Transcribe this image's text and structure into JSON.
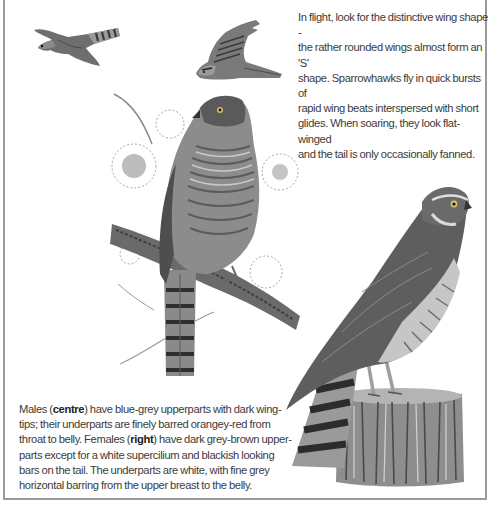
{
  "captions": {
    "flight": {
      "lines": [
        "In flight, look for the distinctive wing shape -",
        "the rather rounded wings almost form an 'S'",
        "shape. Sparrowhawks fly in quick bursts of",
        "rapid wing beats interspersed with short",
        "glides. When soaring, they look flat-winged",
        "and the tail is only occasionally fanned."
      ]
    },
    "plumage": {
      "line1_a": "Males (",
      "line1_bold": "centre",
      "line1_b": ") have blue-grey upperparts with dark wing-",
      "line2": "tips; their underparts are finely barred orangey-red from",
      "line3_a": "throat to belly. Females (",
      "line3_bold": "right",
      "line3_b": ") have dark grey-brown upper-",
      "line4": "parts except for a white supercilium and blackish looking",
      "line5": "bars on the tail. The underparts are white, with fine grey",
      "line6": "horizontal barring from the upper breast to the belly."
    }
  },
  "illustrations": {
    "flying_left": "sparrowhawk in flight, gliding (top-left)",
    "flying_right": "sparrowhawk in flight, wings raised (top-centre)",
    "male_perched": "male sparrowhawk perched on pine branch (centre)",
    "female_perched": "female sparrowhawk perched on tree stump (right)"
  },
  "colors": {
    "frame_border": "#9a9a9a",
    "text": "#3b3b3b",
    "background": "#ffffff"
  }
}
